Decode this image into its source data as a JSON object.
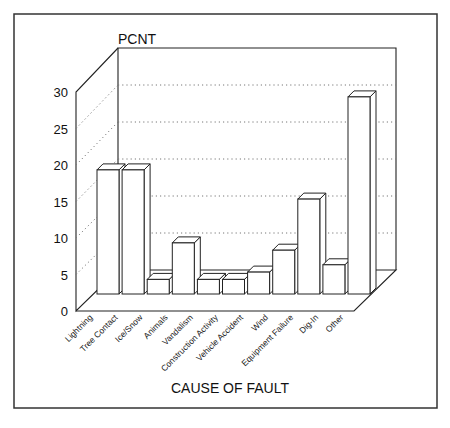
{
  "chart_data": {
    "type": "bar",
    "title": "",
    "ylabel": "PCNT",
    "xlabel": "CAUSE OF FAULT",
    "ylim": [
      0,
      30
    ],
    "yticks": [
      0,
      5,
      10,
      15,
      20,
      25,
      30
    ],
    "grid": true,
    "legend": null,
    "style": "3d",
    "categories": [
      "Lightning",
      "Tree Contact",
      "Ice/Snow",
      "Animals",
      "Vandalism",
      "Construction Activity",
      "Vehicle Accident",
      "Wind",
      "Equipment Failure",
      "Dig-In",
      "Other"
    ],
    "values": [
      17,
      17,
      2,
      7,
      2,
      2,
      3,
      6,
      13,
      4,
      27
    ]
  },
  "colors": {
    "bar_fill": "#ffffff",
    "stroke": "#222222",
    "background": "#ffffff"
  }
}
